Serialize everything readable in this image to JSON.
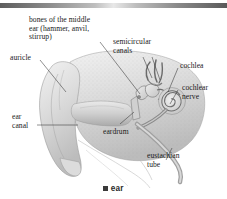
{
  "figure": {
    "caption_bullet": "■",
    "caption_text": "ear",
    "title": "ear"
  },
  "labels": {
    "ossicles": "bones of the middle\near (hammer, anvil,\nstirrup)",
    "semicircular_canals": "semicircular\ncanals",
    "auricle": "auricle",
    "cochlea": "cochlea",
    "cochlear_nerve": "cochlear\nnerve",
    "ear_canal": "ear\ncanal",
    "eardrum": "eardrum",
    "eustachian_tube": "eustachian\ntube"
  },
  "colors": {
    "rule_dark": "#5d5d5d",
    "rule_light": "#e8e8e8",
    "label_text": "#1a1a1a",
    "leader_line": "#333333",
    "caption_text": "#2a2a2a",
    "art_light": "#e2e2e2",
    "art_mid": "#b9b9b9",
    "art_dark": "#7e7e7e",
    "background": "#ffffff"
  }
}
